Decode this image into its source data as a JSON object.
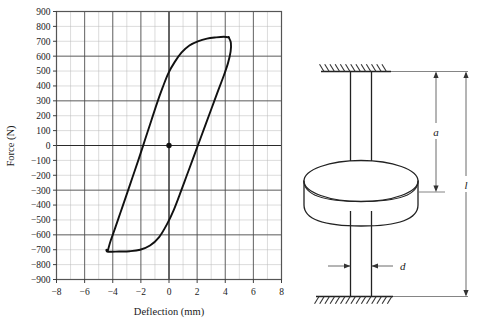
{
  "figure": {
    "panels": [
      "hysteresis-plot",
      "rotor-shaft-diagram"
    ]
  },
  "chart_data": {
    "type": "line",
    "title": "",
    "xlabel": "Deflection (mm)",
    "ylabel": "Force (N)",
    "xlim": [
      -8,
      8
    ],
    "ylim": [
      -900,
      900
    ],
    "xticks": [
      -8,
      -6,
      -4,
      -2,
      0,
      2,
      4,
      6,
      8
    ],
    "xtick_labels": [
      "−8",
      "−6",
      "−4",
      "−2",
      "0",
      "2",
      "4",
      "6",
      "8"
    ],
    "yticks": [
      900,
      800,
      700,
      600,
      500,
      400,
      300,
      200,
      100,
      0,
      -100,
      -200,
      -300,
      -400,
      -500,
      -600,
      -700,
      -800,
      -900
    ],
    "ytick_labels": [
      "900",
      "800",
      "700",
      "600",
      "500",
      "400",
      "300",
      "200",
      "100",
      "0",
      "−100",
      "−200",
      "−300",
      "−400",
      "−500",
      "−600",
      "−700",
      "−800",
      "−900"
    ],
    "grid": true,
    "minor_grid": true,
    "minor_x_step": 1,
    "minor_y_step": 100,
    "major_x_step": 2,
    "major_y_step": 300,
    "legend": null,
    "series": [
      {
        "name": "hysteresis-loop",
        "kind": "closed-loop",
        "description": "Force-deflection hysteresis loop, upper (loading) branch and lower (unloading) branch",
        "upper_branch": [
          [
            -4.35,
            -705
          ],
          [
            -4.15,
            -640
          ],
          [
            -3.85,
            -560
          ],
          [
            -3.45,
            -450
          ],
          [
            -3.05,
            -340
          ],
          [
            -2.6,
            -215
          ],
          [
            -2.15,
            -90
          ],
          [
            -1.7,
            40
          ],
          [
            -1.25,
            170
          ],
          [
            -0.85,
            285
          ],
          [
            -0.45,
            390
          ],
          [
            -0.05,
            485
          ],
          [
            0.4,
            560
          ],
          [
            0.9,
            625
          ],
          [
            1.45,
            672
          ],
          [
            2.05,
            700
          ],
          [
            2.7,
            718
          ],
          [
            3.35,
            726
          ],
          [
            3.9,
            730
          ],
          [
            4.25,
            726
          ]
        ],
        "lower_branch": [
          [
            4.25,
            726
          ],
          [
            4.4,
            690
          ],
          [
            4.38,
            630
          ],
          [
            4.2,
            555
          ],
          [
            3.9,
            470
          ],
          [
            3.5,
            370
          ],
          [
            3.05,
            255
          ],
          [
            2.6,
            140
          ],
          [
            2.15,
            25
          ],
          [
            1.7,
            -90
          ],
          [
            1.25,
            -205
          ],
          [
            0.8,
            -320
          ],
          [
            0.35,
            -430
          ],
          [
            -0.15,
            -530
          ],
          [
            -0.7,
            -615
          ],
          [
            -1.35,
            -672
          ],
          [
            -2.05,
            -700
          ],
          [
            -2.8,
            -710
          ],
          [
            -3.55,
            -712
          ],
          [
            -4.1,
            -714
          ],
          [
            -4.4,
            -712
          ],
          [
            -4.45,
            -700
          ],
          [
            -4.35,
            -705
          ]
        ]
      }
    ],
    "markers": [
      {
        "name": "origin-point",
        "x": 0,
        "y": 0,
        "style": "filled-circle"
      }
    ]
  },
  "diagram": {
    "name": "shaft-with-central-disk",
    "labels": {
      "a": "a",
      "l": "l",
      "d": "d"
    },
    "parts": [
      "top-fixed-support",
      "upper-shaft",
      "disk",
      "lower-shaft",
      "bottom-fixed-support",
      "dimension-a",
      "dimension-l",
      "dimension-d"
    ]
  }
}
